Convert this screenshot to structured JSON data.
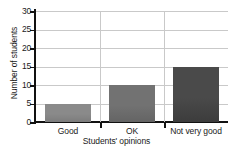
{
  "chart_data": {
    "type": "bar",
    "title": "",
    "categories": [
      "Good",
      "OK",
      "Not very good"
    ],
    "values": [
      5,
      10,
      15
    ],
    "xlabel": "Students' opinions",
    "ylabel": "Number of students",
    "ylim": [
      0,
      30
    ],
    "yticks": [
      0,
      5,
      10,
      15,
      20,
      25,
      30
    ],
    "ytick_labels": [
      "0",
      "5",
      "10",
      "15",
      "20",
      "25",
      "30"
    ],
    "grid": "horizontal-and-category-separators",
    "legend": "none",
    "bar_colors": [
      "#8a8a8a",
      "#727272",
      "#4a4a4a"
    ],
    "gridline_color": "#c9c9c9",
    "axis_color": "#111111",
    "background_color": "#ffffff"
  }
}
